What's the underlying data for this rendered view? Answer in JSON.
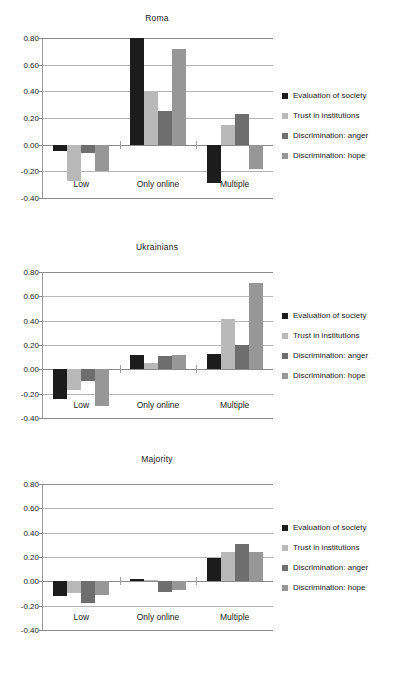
{
  "figure": {
    "series_names": [
      "Evaluation of society",
      "Trust in institutions",
      "Discrimination: anger",
      "Discrimination: hope"
    ],
    "series_colors": [
      "#1c1c1c",
      "#b9b9b9",
      "#6e6e6e",
      "#979797"
    ],
    "categories": [
      "Low",
      "Only online",
      "Multiple"
    ],
    "y_ticks": [
      "0.80",
      "0.60",
      "0.40",
      "0.20",
      "0.00",
      "-0.20",
      "-0.40"
    ]
  },
  "chart_data": [
    {
      "type": "bar",
      "title": "Roma",
      "xlabel": "",
      "ylabel": "",
      "ylim": [
        -0.4,
        0.8
      ],
      "yticks": [
        0.8,
        0.6,
        0.4,
        0.2,
        0.0,
        -0.2,
        -0.4
      ],
      "grid": true,
      "legend_position": "right",
      "categories": [
        "Low",
        "Only online",
        "Multiple"
      ],
      "series": [
        {
          "name": "Evaluation of society",
          "color": "#1c1c1c",
          "values": [
            -0.05,
            0.8,
            -0.29
          ]
        },
        {
          "name": "Trust in institutions",
          "color": "#b9b9b9",
          "values": [
            -0.27,
            0.4,
            0.15
          ]
        },
        {
          "name": "Discrimination: anger",
          "color": "#6e6e6e",
          "values": [
            -0.06,
            0.25,
            0.23
          ]
        },
        {
          "name": "Discrimination: hope",
          "color": "#979797",
          "values": [
            -0.2,
            0.72,
            -0.18
          ]
        }
      ]
    },
    {
      "type": "bar",
      "title": "Ukrainians",
      "xlabel": "",
      "ylabel": "",
      "ylim": [
        -0.4,
        0.8
      ],
      "yticks": [
        0.8,
        0.6,
        0.4,
        0.2,
        0.0,
        -0.2,
        -0.4
      ],
      "grid": true,
      "legend_position": "right",
      "categories": [
        "Low",
        "Only online",
        "Multiple"
      ],
      "series": [
        {
          "name": "Evaluation of society",
          "color": "#1c1c1c",
          "values": [
            -0.24,
            0.12,
            0.13
          ]
        },
        {
          "name": "Trust in institutions",
          "color": "#b9b9b9",
          "values": [
            -0.17,
            0.05,
            0.41
          ]
        },
        {
          "name": "Discrimination: anger",
          "color": "#6e6e6e",
          "values": [
            -0.1,
            0.11,
            0.2
          ]
        },
        {
          "name": "Discrimination: hope",
          "color": "#979797",
          "values": [
            -0.3,
            0.12,
            0.71
          ]
        }
      ]
    },
    {
      "type": "bar",
      "title": "Majority",
      "xlabel": "",
      "ylabel": "",
      "ylim": [
        -0.4,
        0.8
      ],
      "yticks": [
        0.8,
        0.6,
        0.4,
        0.2,
        0.0,
        -0.2,
        -0.4
      ],
      "grid": true,
      "legend_position": "right",
      "categories": [
        "Low",
        "Only online",
        "Multiple"
      ],
      "series": [
        {
          "name": "Evaluation of society",
          "color": "#1c1c1c",
          "values": [
            -0.12,
            0.02,
            0.19
          ]
        },
        {
          "name": "Trust in institutions",
          "color": "#b9b9b9",
          "values": [
            -0.1,
            0.01,
            0.24
          ]
        },
        {
          "name": "Discrimination: anger",
          "color": "#6e6e6e",
          "values": [
            -0.18,
            -0.09,
            0.31
          ]
        },
        {
          "name": "Discrimination: hope",
          "color": "#979797",
          "values": [
            -0.11,
            -0.07,
            0.24
          ]
        }
      ]
    }
  ]
}
